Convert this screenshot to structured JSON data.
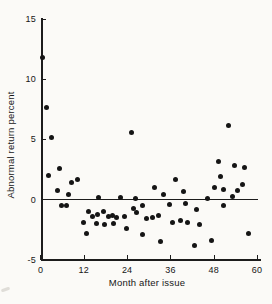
{
  "figure": {
    "background": "#fbfaf7",
    "ink": "#1c1c1c"
  },
  "chart_data": {
    "type": "scatter",
    "title": "",
    "xlabel": "Month after issue",
    "ylabel": "Abnormal return percent",
    "xlim": [
      0,
      61
    ],
    "ylim": [
      -5,
      15
    ],
    "x_ticks": [
      0,
      12,
      24,
      36,
      48,
      60
    ],
    "y_ticks": [
      15,
      10,
      5,
      0,
      "-5"
    ],
    "grid": false,
    "legend": "none",
    "zero_line": true,
    "marker": {
      "shape": "circle",
      "color": "#151515",
      "diameter_px": 5
    },
    "points": [
      [
        0.3,
        11.8
      ],
      [
        1.5,
        7.7
      ],
      [
        3,
        5.2
      ],
      [
        2,
        2.0
      ],
      [
        5,
        2.6
      ],
      [
        4.5,
        0.75
      ],
      [
        7.5,
        0.4
      ],
      [
        8.5,
        1.45
      ],
      [
        10,
        1.7
      ],
      [
        5.7,
        -0.5
      ],
      [
        7,
        -0.5
      ],
      [
        11.7,
        -1.9
      ],
      [
        12.6,
        -2.85
      ],
      [
        13.2,
        -1.0
      ],
      [
        14.3,
        -1.4
      ],
      [
        15.6,
        -1.25
      ],
      [
        15.5,
        -2.0
      ],
      [
        16,
        0.2
      ],
      [
        17.3,
        -1.0
      ],
      [
        17.6,
        -2.1
      ],
      [
        18.6,
        -1.4
      ],
      [
        19.7,
        -1.3
      ],
      [
        20.1,
        -2.0
      ],
      [
        21,
        -1.5
      ],
      [
        22,
        0.15
      ],
      [
        23.1,
        -1.4
      ],
      [
        23.7,
        -2.4
      ],
      [
        25,
        5.6
      ],
      [
        25.7,
        -0.75
      ],
      [
        26.3,
        0.1
      ],
      [
        26.5,
        -1.1
      ],
      [
        28,
        -0.5
      ],
      [
        28.1,
        -2.9
      ],
      [
        29.3,
        -1.6
      ],
      [
        31,
        -1.5
      ],
      [
        31.5,
        1.0
      ],
      [
        32.6,
        -1.3
      ],
      [
        33.2,
        -3.5
      ],
      [
        34,
        0.4
      ],
      [
        35.5,
        -0.4
      ],
      [
        36.3,
        -1.9
      ],
      [
        37.2,
        1.65
      ],
      [
        38.6,
        -1.75
      ],
      [
        39.4,
        0.7
      ],
      [
        40,
        -0.3
      ],
      [
        40.7,
        -1.9
      ],
      [
        42.6,
        -3.85
      ],
      [
        43.2,
        -0.8
      ],
      [
        43.9,
        -2.1
      ],
      [
        46,
        0.1
      ],
      [
        47.2,
        -3.4
      ],
      [
        48,
        1.0
      ],
      [
        49.3,
        3.2
      ],
      [
        49.7,
        1.9
      ],
      [
        50.5,
        0.85
      ],
      [
        50.7,
        -0.45
      ],
      [
        52,
        6.2
      ],
      [
        53,
        0.3
      ],
      [
        53.5,
        2.8
      ],
      [
        54.5,
        0.75
      ],
      [
        55.7,
        1.3
      ],
      [
        56.4,
        2.7
      ],
      [
        57.6,
        -2.8
      ]
    ]
  }
}
